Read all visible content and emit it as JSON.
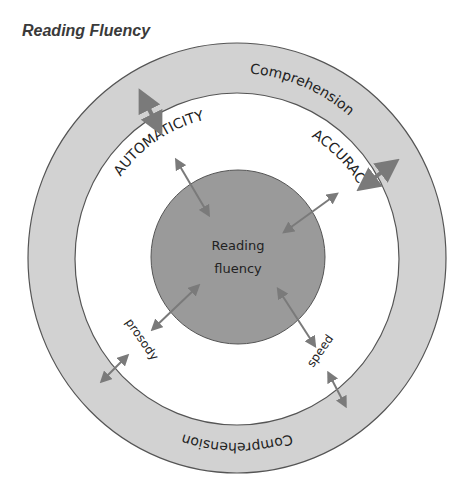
{
  "title": "Reading Fluency",
  "diagram": {
    "center_label_line1": "Reading",
    "center_label_line2": "fluency",
    "outer_ring_label_top": "Comprehension",
    "outer_ring_label_bottom": "Comprehension",
    "components": {
      "automaticity": "AUTOMATICITY",
      "accuracy": "ACCURACY",
      "prosody": "prosody",
      "speed": "speed"
    },
    "colors": {
      "outer_ring": "#d2d2d2",
      "inner_disk": "#9a9a9a",
      "arrow": "#7a7a7a",
      "outline": "#555555"
    }
  }
}
